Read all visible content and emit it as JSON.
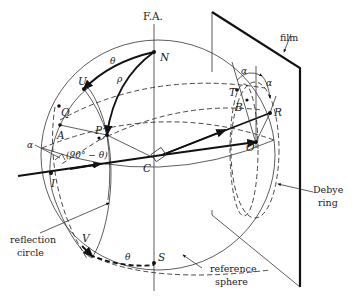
{
  "diagram": {
    "axis_label": "F.A.",
    "points": {
      "N": "N",
      "U": "U",
      "Q": "Q",
      "A": "A",
      "P": "P",
      "I": "I",
      "C": "C",
      "V": "V",
      "S": "S",
      "T": "T",
      "B": "B",
      "R": "R",
      "O": "O"
    },
    "angles": {
      "theta_top": "θ",
      "rho": "ρ",
      "alpha_left": "α",
      "ninety_minus_theta": "(90° − θ)",
      "theta_bottom": "θ",
      "alpha_top1": "α",
      "alpha_top2": "α"
    },
    "annotations": {
      "film": "film",
      "debye_ring_line1": "Debye",
      "debye_ring_line2": "ring",
      "reflection_circle_line1": "reflection",
      "reflection_circle_line2": "circle",
      "reference_sphere_line1": "reference",
      "reference_sphere_line2": "sphere"
    }
  }
}
